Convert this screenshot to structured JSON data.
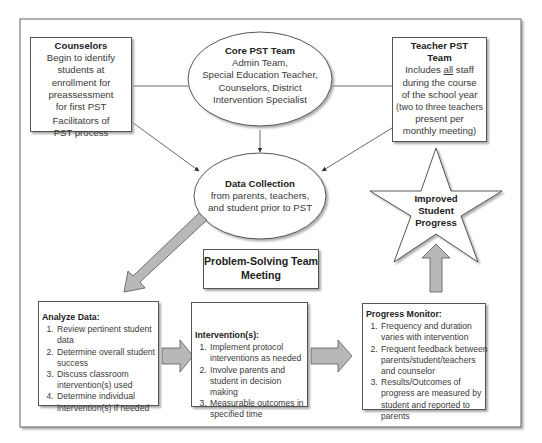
{
  "diagram": {
    "counselors": {
      "title": "Counselors",
      "line1": "Begin to identify",
      "line2": "students at",
      "line3": "enrollment for",
      "line4": "preassessment",
      "line5": "for first PST",
      "line6": "Facilitators of",
      "line7": "PST process"
    },
    "core_team": {
      "title": "Core PST Team",
      "line1": "Admin Team,",
      "line2": "Special Education Teacher,",
      "line3": "Counselors, District",
      "line4": "Intervention Specialist"
    },
    "teacher_team": {
      "title1": "Teacher PST",
      "title2": "Team",
      "line1a": "Includes ",
      "line1b": "all",
      "line1c": " staff",
      "line2": "during the course",
      "line3": "of the school year",
      "line4": "(two to three teachers",
      "line5": "present per",
      "line6": "monthly meeting)"
    },
    "data_collection": {
      "title": "Data Collection",
      "line1": "from parents, teachers,",
      "line2": "and student prior to PST"
    },
    "star": {
      "line1": "Improved",
      "line2": "Student",
      "line3": "Progress"
    },
    "meeting": {
      "line1": "Problem-Solving Team",
      "line2": "Meeting"
    },
    "analyze": {
      "title": "Analyze Data:",
      "items": [
        "Review pertinent student data",
        "Determine overall student success",
        "Discuss classroom intervention(s) used",
        "Determine individual intervention(s) if needed"
      ]
    },
    "interventions": {
      "title": "Intervention(s):",
      "items": [
        "Implement protocol interventions as needed",
        "Involve parents and student in decision making",
        "Measurable outcomes in specified time"
      ]
    },
    "progress": {
      "title": "Progress Monitor:",
      "items": [
        "Frequency and duration varies with intervention",
        "Frequent feedback between parents/student/teachers and counselor",
        "Results/Outcomes of progress are measured by student and reported to parents"
      ]
    }
  },
  "colors": {
    "arrow_fill": "#b8b8b8",
    "stroke": "#555555"
  }
}
